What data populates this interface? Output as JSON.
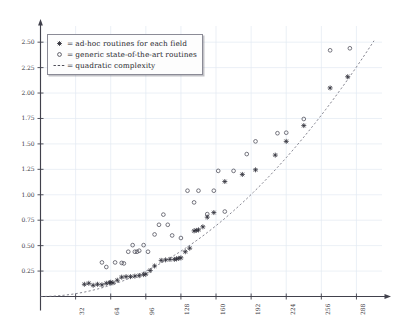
{
  "chart_data": {
    "type": "scatter",
    "title": "",
    "xlabel": "",
    "ylabel": "",
    "xlim": [
      0,
      304
    ],
    "ylim": [
      0,
      2.6
    ],
    "grid": true,
    "legend_position": "top-left",
    "x_ticks": [
      32,
      64,
      96,
      128,
      160,
      192,
      224,
      256,
      288
    ],
    "x_tick_labels": [
      "32",
      "64",
      "96",
      "128",
      "160",
      "192",
      "224",
      "256",
      "288"
    ],
    "y_ticks": [
      0.25,
      0.5,
      0.75,
      1.0,
      1.25,
      1.5,
      1.75,
      2.0,
      2.25,
      2.5
    ],
    "y_tick_labels": [
      "0.25",
      "0.50",
      "0.75",
      "1.00",
      "1.25",
      "1.50",
      "1.75",
      "2.00",
      "2.25",
      "2.50"
    ],
    "legend": [
      {
        "marker": "star",
        "eq": "=",
        "label": "ad-hoc routines for each field"
      },
      {
        "marker": "circle",
        "eq": "=",
        "label": "generic state-of-the-art routines"
      },
      {
        "marker": "dash",
        "eq": "=",
        "label": "quadratic complexity"
      }
    ],
    "series": [
      {
        "name": "ad-hoc routines for each field",
        "marker": "star",
        "color": "#2f2f38",
        "points": [
          [
            40,
            0.12
          ],
          [
            44,
            0.13
          ],
          [
            48,
            0.11
          ],
          [
            52,
            0.12
          ],
          [
            56,
            0.115
          ],
          [
            60,
            0.13
          ],
          [
            63,
            0.135
          ],
          [
            64,
            0.14
          ],
          [
            66,
            0.135
          ],
          [
            70,
            0.16
          ],
          [
            74,
            0.19
          ],
          [
            78,
            0.195
          ],
          [
            82,
            0.195
          ],
          [
            86,
            0.2
          ],
          [
            90,
            0.205
          ],
          [
            94,
            0.215
          ],
          [
            96,
            0.22
          ],
          [
            100,
            0.255
          ],
          [
            104,
            0.3
          ],
          [
            110,
            0.355
          ],
          [
            114,
            0.36
          ],
          [
            118,
            0.365
          ],
          [
            122,
            0.365
          ],
          [
            124,
            0.37
          ],
          [
            126,
            0.375
          ],
          [
            128,
            0.38
          ],
          [
            132,
            0.44
          ],
          [
            136,
            0.475
          ],
          [
            140,
            0.645
          ],
          [
            142,
            0.65
          ],
          [
            144,
            0.655
          ],
          [
            148,
            0.685
          ],
          [
            152,
            0.78
          ],
          [
            158,
            0.825
          ],
          [
            168,
            1.13
          ],
          [
            184,
            1.2
          ],
          [
            196,
            1.245
          ],
          [
            214,
            1.39
          ],
          [
            224,
            1.525
          ],
          [
            240,
            1.68
          ],
          [
            264,
            2.05
          ],
          [
            280,
            2.16
          ]
        ]
      },
      {
        "name": "generic state-of-the-art routines",
        "marker": "circle",
        "color": "#4a4a55",
        "points": [
          [
            56,
            0.335
          ],
          [
            60,
            0.29
          ],
          [
            68,
            0.335
          ],
          [
            74,
            0.33
          ],
          [
            76,
            0.325
          ],
          [
            80,
            0.44
          ],
          [
            84,
            0.505
          ],
          [
            86,
            0.44
          ],
          [
            88,
            0.44
          ],
          [
            90,
            0.45
          ],
          [
            94,
            0.505
          ],
          [
            98,
            0.44
          ],
          [
            104,
            0.61
          ],
          [
            108,
            0.705
          ],
          [
            112,
            0.805
          ],
          [
            116,
            0.705
          ],
          [
            120,
            0.6
          ],
          [
            128,
            0.575
          ],
          [
            134,
            1.04
          ],
          [
            140,
            0.925
          ],
          [
            144,
            1.04
          ],
          [
            152,
            0.81
          ],
          [
            158,
            1.04
          ],
          [
            162,
            1.235
          ],
          [
            168,
            0.835
          ],
          [
            176,
            1.235
          ],
          [
            196,
            1.525
          ],
          [
            188,
            1.4
          ],
          [
            216,
            1.605
          ],
          [
            224,
            1.61
          ],
          [
            240,
            1.745
          ],
          [
            264,
            2.42
          ],
          [
            282,
            2.44
          ]
        ]
      }
    ],
    "curve": {
      "name": "quadratic complexity",
      "style": "dashed",
      "color": "#6f6f7c",
      "formula_note": "quadratic",
      "coefficient": 2.72e-05
    }
  }
}
